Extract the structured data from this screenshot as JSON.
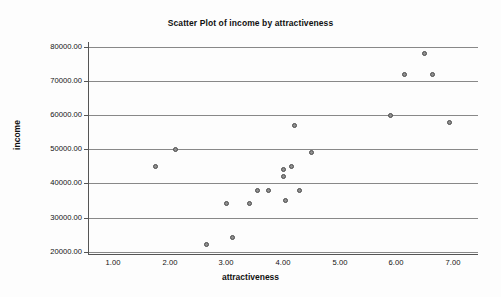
{
  "chart_data": {
    "type": "scatter",
    "title": "Scatter Plot of income by attractiveness",
    "xlabel": "attractiveness",
    "ylabel": "income",
    "xlim": [
      0.55,
      7.45
    ],
    "ylim": [
      19000,
      81500
    ],
    "xticks": [
      "1.00",
      "2.00",
      "3.00",
      "4.00",
      "5.00",
      "6.00",
      "7.00"
    ],
    "xtick_values": [
      1,
      2,
      3,
      4,
      5,
      6,
      7
    ],
    "yticks": [
      "20000.00",
      "30000.00",
      "40000.00",
      "50000.00",
      "60000.00",
      "70000.00",
      "80000.00"
    ],
    "ytick_values": [
      20000,
      30000,
      40000,
      50000,
      60000,
      70000,
      80000
    ],
    "grid": "horizontal",
    "legend": null,
    "marker_color": "#8f8f8f",
    "marker_edge_color": "#4a4a4a",
    "gridline_color": "#888888",
    "axis_color": "#555555",
    "background_color": "#fdfdfd",
    "x": [
      1.75,
      2.1,
      2.65,
      3.0,
      3.1,
      3.4,
      3.55,
      3.75,
      4.0,
      4.0,
      4.05,
      4.15,
      4.2,
      4.3,
      4.5,
      5.9,
      6.15,
      6.5,
      6.65,
      6.95
    ],
    "y": [
      45000,
      50000,
      22000,
      34000,
      24000,
      34000,
      38000,
      38000,
      44000,
      42000,
      35000,
      45000,
      57000,
      38000,
      49000,
      60000,
      72000,
      78000,
      72000,
      58000
    ],
    "points": [
      {
        "x": 1.75,
        "y": 45000
      },
      {
        "x": 2.1,
        "y": 50000
      },
      {
        "x": 2.65,
        "y": 22000
      },
      {
        "x": 3.0,
        "y": 34000
      },
      {
        "x": 3.1,
        "y": 24000
      },
      {
        "x": 3.4,
        "y": 34000
      },
      {
        "x": 3.55,
        "y": 38000
      },
      {
        "x": 3.75,
        "y": 38000
      },
      {
        "x": 4.0,
        "y": 44000
      },
      {
        "x": 4.0,
        "y": 42000
      },
      {
        "x": 4.05,
        "y": 35000
      },
      {
        "x": 4.15,
        "y": 45000
      },
      {
        "x": 4.2,
        "y": 57000
      },
      {
        "x": 4.3,
        "y": 38000
      },
      {
        "x": 4.5,
        "y": 49000
      },
      {
        "x": 5.9,
        "y": 60000
      },
      {
        "x": 6.15,
        "y": 72000
      },
      {
        "x": 6.5,
        "y": 78000
      },
      {
        "x": 6.65,
        "y": 72000
      },
      {
        "x": 6.95,
        "y": 58000
      }
    ]
  }
}
